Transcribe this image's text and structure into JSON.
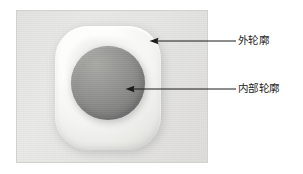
{
  "figure": {
    "type": "annotated-photo-diagram",
    "background_color": "#ffffff",
    "photo": {
      "border_color": "#d2d2d0",
      "background_color": "#e6e6e4",
      "subject": "white rounded-square object with circular gray inset"
    },
    "objects": {
      "outer_shape_color": "#fbfbf9",
      "inner_disc_color": "#8f8f8e"
    },
    "annotations": [
      {
        "id": "outer-contour",
        "label": "外轮廓",
        "arrow_color": "#1c1c1c",
        "arrow_direction": "left",
        "points_to": "outer rounded-square edge"
      },
      {
        "id": "inner-contour",
        "label": "内部轮廓",
        "arrow_color": "#1c1c1c",
        "arrow_direction": "left",
        "points_to": "inner circular disc"
      }
    ]
  }
}
